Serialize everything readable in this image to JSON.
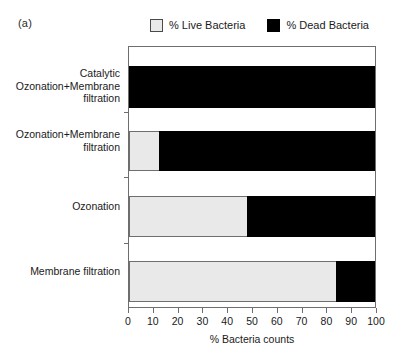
{
  "panel": {
    "label": "(a)"
  },
  "legend": {
    "entries": [
      {
        "label": "% Live Bacteria",
        "key": "live",
        "color": "#e9e9e9"
      },
      {
        "label": "% Dead Bacteria",
        "key": "dead",
        "color": "#000000"
      }
    ]
  },
  "axis": {
    "x_title": "% Bacteria counts",
    "tick_labels": [
      "0",
      "10",
      "20",
      "30",
      "40",
      "50",
      "60",
      "70",
      "80",
      "90",
      "100"
    ]
  },
  "categories": [
    {
      "lines": [
        "Catalytic",
        "Ozonation+Membrane",
        "filtration"
      ]
    },
    {
      "lines": [
        "Ozonation+Membrane",
        "filtration"
      ]
    },
    {
      "lines": [
        "Ozonation"
      ]
    },
    {
      "lines": [
        "Membrane filtration"
      ]
    }
  ],
  "chart_data": {
    "type": "bar",
    "orientation": "horizontal",
    "stacked": true,
    "title": "",
    "subtitle": "",
    "annotations": [
      "(a)"
    ],
    "xlabel": "% Bacteria counts",
    "ylabel": "",
    "xlim": [
      0,
      100
    ],
    "xticks": [
      0,
      10,
      20,
      30,
      40,
      50,
      60,
      70,
      80,
      90,
      100
    ],
    "grid": false,
    "legend_position": "top",
    "categories": [
      "Catalytic Ozonation+Membrane filtration",
      "Ozonation+Membrane filtration",
      "Ozonation",
      "Membrane filtration"
    ],
    "series": [
      {
        "name": "% Live Bacteria",
        "color": "#e9e9e9",
        "values": [
          0,
          12,
          48,
          84
        ]
      },
      {
        "name": "% Dead Bacteria",
        "color": "#000000",
        "values": [
          100,
          88,
          52,
          16
        ]
      }
    ]
  }
}
